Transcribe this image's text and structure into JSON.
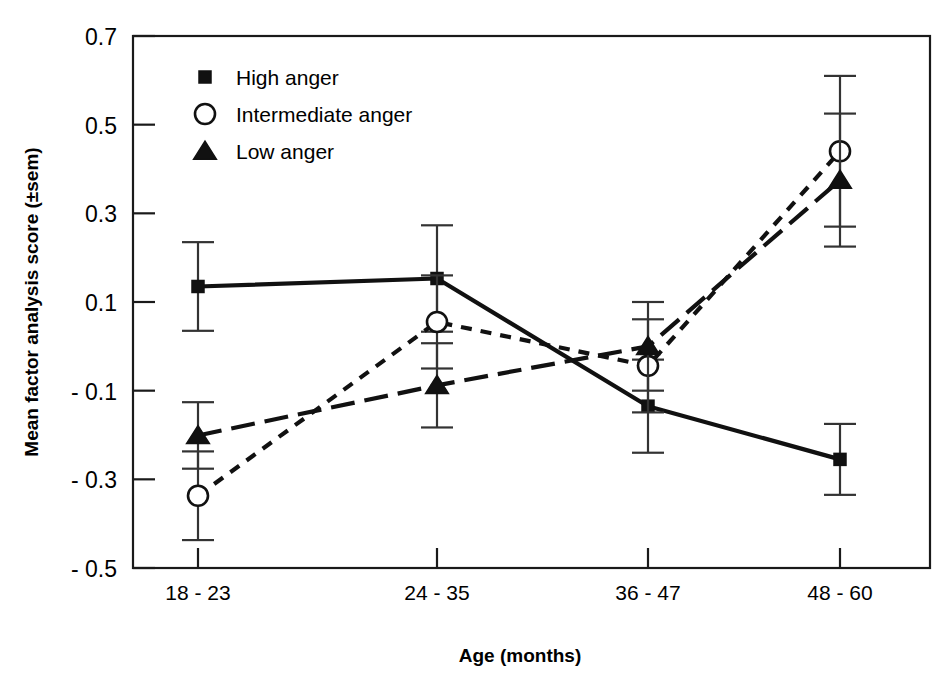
{
  "chart_data": {
    "type": "line",
    "title": "",
    "subtitle": "",
    "xlabel": "Age (months)",
    "ylabel": "Mean factor analysis score (±sem)",
    "categories": [
      "18 - 23",
      "24 - 35",
      "36 - 47",
      "48 - 60"
    ],
    "ylim": [
      -0.5,
      0.7
    ],
    "yticks": [
      "0.7",
      "0.5",
      "0.3",
      "0.1",
      "- 0.1",
      "- 0.3",
      "- 0.5"
    ],
    "ytick_values": [
      0.7,
      0.5,
      0.3,
      0.1,
      -0.1,
      -0.3,
      -0.5
    ],
    "grid": false,
    "frame": "box",
    "legend_position": "top-left inside",
    "error_bars": "sem",
    "series": [
      {
        "name": "High anger",
        "marker": "filled-square",
        "line_style": "solid",
        "color": "#000000",
        "values": [
          0.135,
          0.153,
          -0.135,
          -0.255
        ],
        "errors": [
          0.1,
          0.12,
          0.105,
          0.08
        ]
      },
      {
        "name": "Intermediate anger",
        "marker": "open-circle",
        "line_style": "short-dash",
        "color": "#000000",
        "values": [
          -0.337,
          0.055,
          -0.044,
          0.44
        ],
        "errors": [
          0.1,
          0.105,
          0.105,
          0.17
        ]
      },
      {
        "name": "Low anger",
        "marker": "filled-triangle",
        "line_style": "long-dash",
        "color": "#000000",
        "values": [
          -0.201,
          -0.088,
          0.0,
          0.375
        ],
        "errors": [
          0.075,
          0.095,
          0.1,
          0.15
        ]
      }
    ]
  },
  "legend": {
    "items": [
      {
        "label": "High anger",
        "marker": "filled-square"
      },
      {
        "label": "Intermediate anger",
        "marker": "open-circle"
      },
      {
        "label": "Low anger",
        "marker": "filled-triangle"
      }
    ]
  },
  "axes": {
    "y_title": "Mean factor analysis score (±sem)",
    "x_title": "Age (months)"
  }
}
